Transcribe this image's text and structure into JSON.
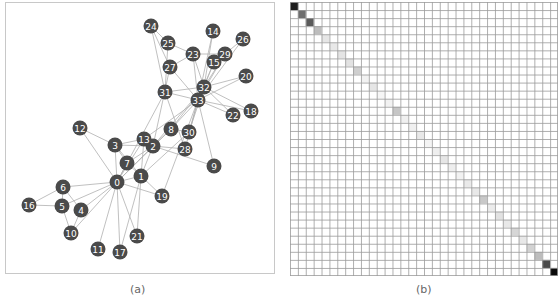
{
  "figure": {
    "panel_a": {
      "caption": "(a)",
      "node_color": "#4a4a4a",
      "edge_color": "#b0b0b0",
      "label_color": "#ffffff",
      "nodes": [
        {
          "id": "0",
          "x": 111,
          "y": 179
        },
        {
          "id": "1",
          "x": 135,
          "y": 173
        },
        {
          "id": "2",
          "x": 147,
          "y": 143
        },
        {
          "id": "3",
          "x": 109,
          "y": 142
        },
        {
          "id": "4",
          "x": 75,
          "y": 207
        },
        {
          "id": "5",
          "x": 56,
          "y": 203
        },
        {
          "id": "6",
          "x": 57,
          "y": 184
        },
        {
          "id": "7",
          "x": 121,
          "y": 160
        },
        {
          "id": "8",
          "x": 165,
          "y": 126
        },
        {
          "id": "9",
          "x": 208,
          "y": 163
        },
        {
          "id": "10",
          "x": 65,
          "y": 230
        },
        {
          "id": "11",
          "x": 92,
          "y": 246
        },
        {
          "id": "12",
          "x": 74,
          "y": 125
        },
        {
          "id": "13",
          "x": 138,
          "y": 136
        },
        {
          "id": "14",
          "x": 207,
          "y": 28
        },
        {
          "id": "15",
          "x": 208,
          "y": 59
        },
        {
          "id": "16",
          "x": 23,
          "y": 202
        },
        {
          "id": "17",
          "x": 114,
          "y": 249
        },
        {
          "id": "18",
          "x": 245,
          "y": 108
        },
        {
          "id": "19",
          "x": 156,
          "y": 193
        },
        {
          "id": "20",
          "x": 240,
          "y": 73
        },
        {
          "id": "21",
          "x": 131,
          "y": 233
        },
        {
          "id": "22",
          "x": 227,
          "y": 112
        },
        {
          "id": "23",
          "x": 187,
          "y": 51
        },
        {
          "id": "24",
          "x": 145,
          "y": 23
        },
        {
          "id": "25",
          "x": 162,
          "y": 40
        },
        {
          "id": "26",
          "x": 237,
          "y": 36
        },
        {
          "id": "27",
          "x": 164,
          "y": 64
        },
        {
          "id": "28",
          "x": 179,
          "y": 146
        },
        {
          "id": "29",
          "x": 219,
          "y": 51
        },
        {
          "id": "30",
          "x": 183,
          "y": 129
        },
        {
          "id": "31",
          "x": 159,
          "y": 89
        },
        {
          "id": "32",
          "x": 198,
          "y": 84
        },
        {
          "id": "33",
          "x": 192,
          "y": 97
        }
      ],
      "edges": [
        [
          0,
          1
        ],
        [
          0,
          2
        ],
        [
          0,
          3
        ],
        [
          0,
          4
        ],
        [
          0,
          5
        ],
        [
          0,
          6
        ],
        [
          0,
          7
        ],
        [
          0,
          8
        ],
        [
          0,
          10
        ],
        [
          0,
          11
        ],
        [
          0,
          12
        ],
        [
          0,
          13
        ],
        [
          0,
          17
        ],
        [
          0,
          19
        ],
        [
          0,
          21
        ],
        [
          0,
          31
        ],
        [
          1,
          2
        ],
        [
          1,
          3
        ],
        [
          1,
          7
        ],
        [
          1,
          13
        ],
        [
          1,
          17
        ],
        [
          1,
          19
        ],
        [
          1,
          21
        ],
        [
          1,
          30
        ],
        [
          2,
          3
        ],
        [
          2,
          7
        ],
        [
          2,
          8
        ],
        [
          2,
          9
        ],
        [
          2,
          13
        ],
        [
          2,
          27
        ],
        [
          2,
          28
        ],
        [
          2,
          32
        ],
        [
          3,
          7
        ],
        [
          3,
          12
        ],
        [
          3,
          13
        ],
        [
          4,
          6
        ],
        [
          4,
          10
        ],
        [
          5,
          6
        ],
        [
          5,
          10
        ],
        [
          5,
          16
        ],
        [
          6,
          16
        ],
        [
          8,
          30
        ],
        [
          8,
          32
        ],
        [
          8,
          33
        ],
        [
          9,
          33
        ],
        [
          13,
          33
        ],
        [
          14,
          32
        ],
        [
          14,
          33
        ],
        [
          15,
          32
        ],
        [
          15,
          33
        ],
        [
          18,
          32
        ],
        [
          18,
          33
        ],
        [
          19,
          33
        ],
        [
          20,
          32
        ],
        [
          20,
          33
        ],
        [
          22,
          32
        ],
        [
          22,
          33
        ],
        [
          23,
          25
        ],
        [
          23,
          27
        ],
        [
          23,
          29
        ],
        [
          23,
          32
        ],
        [
          23,
          33
        ],
        [
          24,
          25
        ],
        [
          24,
          27
        ],
        [
          24,
          31
        ],
        [
          25,
          31
        ],
        [
          26,
          29
        ],
        [
          26,
          33
        ],
        [
          27,
          33
        ],
        [
          28,
          31
        ],
        [
          28,
          33
        ],
        [
          29,
          32
        ],
        [
          29,
          33
        ],
        [
          30,
          32
        ],
        [
          30,
          33
        ],
        [
          31,
          32
        ],
        [
          31,
          33
        ],
        [
          32,
          33
        ]
      ]
    },
    "panel_b": {
      "caption": "(b)",
      "grid_size": 34,
      "grid_line_color": "#9a9a9a",
      "diagonal_shades": [
        "#1e1e1e",
        "#6e6e6e",
        "#5a5a5a",
        "#bdbdbd",
        "#e6e6e6",
        "#e8e8e8",
        "#e4e4e4",
        "#e2e2e2",
        "#cfcfcf",
        "#f2f2f2",
        "#e6e6e6",
        "#f6f6f6",
        "#f2f2f2",
        "#c6c6c6",
        "#f0f0f0",
        "#f0f0f0",
        "#e8e8e8",
        "#f4f4f4",
        "#eeeeee",
        "#e6e6e6",
        "#eeeeee",
        "#f2f2f2",
        "#eaeaea",
        "#e8e8e8",
        "#c8c8c8",
        "#ececec",
        "#e2e2e2",
        "#e8e8e8",
        "#d6d6d6",
        "#e8e8e8",
        "#d2d2d2",
        "#bdbdbd",
        "#4a4a4a",
        "#0a0a0a"
      ]
    }
  }
}
